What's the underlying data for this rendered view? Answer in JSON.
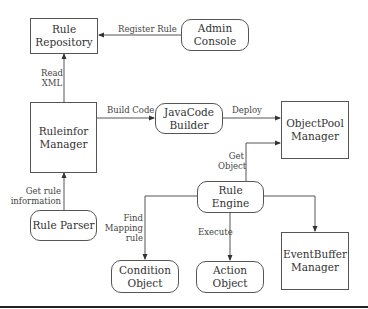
{
  "nodes": {
    "rule_repository": "Rule\nRepository",
    "admin_console": "Admin\nConsole",
    "ruleinfor_manager": "Ruleinfor\nManager",
    "javacode_builder": "JavaCode\nBuilder",
    "objectpool_manager": "ObjectPool\nManager",
    "rule_engine": "Rule Engine",
    "rule_parser": "Rule Parser",
    "condition_object": "Condition\nObject",
    "action_object": "Action Object",
    "eventbuffer_manager": "EventBuffer\nManager"
  },
  "edges": {
    "register_rule": "Register Rule",
    "read_xml": "Read\nXML",
    "build_code": "Build Code",
    "deploy": "Deploy",
    "get_object": "Get\nObject",
    "get_rule_information": "Get rule\ninformation",
    "find_mapping_rule": "Find\nMapping\nrule",
    "execute": "Execute"
  },
  "colors": {
    "line": "#555555",
    "text": "#333333",
    "rule": "#222222"
  }
}
